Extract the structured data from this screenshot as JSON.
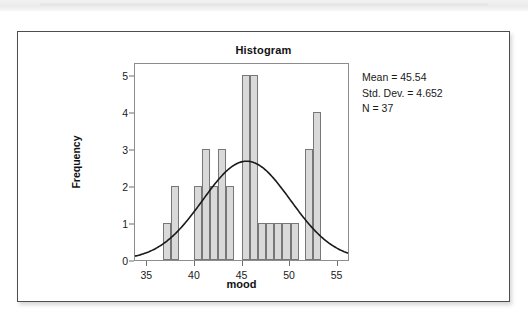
{
  "page": {
    "background_color": "#ffffff",
    "card_border_color": "#4d4d4d"
  },
  "figure": {
    "title": "Histogram",
    "stats": {
      "mean_label": "Mean = 45.54",
      "std_dev_label": "Std. Dev. = 4.652",
      "n_label": "N = 37"
    }
  },
  "chart_data": {
    "type": "bar",
    "title": "Histogram",
    "xlabel": "mood",
    "ylabel": "Frequency",
    "xlim": [
      33.7,
      56.3
    ],
    "ylim": [
      0,
      5.35
    ],
    "xticks": [
      35,
      40,
      45,
      50,
      55
    ],
    "yticks": [
      0,
      1,
      2,
      3,
      4,
      5
    ],
    "grid": false,
    "legend": false,
    "bar_fill_color": "#d9d9d9",
    "bar_edge_color": "#777777",
    "curve_color": "#1a1a1a",
    "bin_width": 0.85,
    "bins": [
      {
        "x0": 36.62,
        "x1": 37.47,
        "height": 1
      },
      {
        "x0": 37.47,
        "x1": 38.32,
        "height": 2
      },
      {
        "x0": 39.85,
        "x1": 40.7,
        "height": 2
      },
      {
        "x0": 40.7,
        "x1": 41.55,
        "height": 3
      },
      {
        "x0": 41.55,
        "x1": 42.4,
        "height": 2
      },
      {
        "x0": 42.4,
        "x1": 43.25,
        "height": 3
      },
      {
        "x0": 43.25,
        "x1": 44.1,
        "height": 2
      },
      {
        "x0": 44.95,
        "x1": 45.8,
        "height": 5
      },
      {
        "x0": 45.8,
        "x1": 46.65,
        "height": 5
      },
      {
        "x0": 46.65,
        "x1": 47.5,
        "height": 1
      },
      {
        "x0": 47.5,
        "x1": 48.35,
        "height": 1
      },
      {
        "x0": 48.35,
        "x1": 49.2,
        "height": 1
      },
      {
        "x0": 49.2,
        "x1": 50.05,
        "height": 1
      },
      {
        "x0": 50.05,
        "x1": 50.9,
        "height": 1
      },
      {
        "x0": 51.6,
        "x1": 52.45,
        "height": 3
      },
      {
        "x0": 52.45,
        "x1": 53.3,
        "height": 4
      }
    ],
    "normal_curve": {
      "mean": 45.54,
      "std_dev": 4.652,
      "n": 37,
      "bin_width": 0.85,
      "peak_value": 3.18
    }
  }
}
